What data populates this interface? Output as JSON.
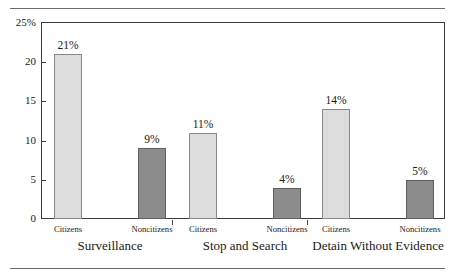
{
  "chart_data": {
    "type": "bar",
    "title": "",
    "subtitle": "",
    "xlabel": "",
    "ylabel": "",
    "ylim": [
      0,
      25
    ],
    "grid": false,
    "legend_position": "none",
    "categories": [
      "Surveillance",
      "Stop and Search",
      "Detain Without Evidence"
    ],
    "series": [
      {
        "name": "Citizens",
        "values": [
          21,
          11,
          14
        ],
        "color": "#dcdcdc"
      },
      {
        "name": "Noncitizens",
        "values": [
          9,
          4,
          5
        ],
        "color": "#8c8c8c"
      }
    ],
    "data_labels": [
      [
        "21%",
        "9%"
      ],
      [
        "11%",
        "4%"
      ],
      [
        "14%",
        "5%"
      ]
    ],
    "yticks": [
      {
        "value": 25,
        "label": "25%"
      },
      {
        "value": 20,
        "label": "20"
      },
      {
        "value": 15,
        "label": "15"
      },
      {
        "value": 10,
        "label": "10"
      },
      {
        "value": 5,
        "label": "5"
      },
      {
        "value": 0,
        "label": "0"
      }
    ],
    "groups": [
      {
        "label": "Surveillance",
        "bars": [
          {
            "series": "Citizens",
            "label": "Citizens",
            "value": 21,
            "value_label": "21%"
          },
          {
            "series": "Noncitizens",
            "label": "Noncitizens",
            "value": 9,
            "value_label": "9%"
          }
        ]
      },
      {
        "label": "Stop and Search",
        "bars": [
          {
            "series": "Citizens",
            "label": "Citizens",
            "value": 11,
            "value_label": "11%"
          },
          {
            "series": "Noncitizens",
            "label": "Noncitizens",
            "value": 4,
            "value_label": "4%"
          }
        ]
      },
      {
        "label": "Detain Without Evidence",
        "bars": [
          {
            "series": "Citizens",
            "label": "Citizens",
            "value": 14,
            "value_label": "14%"
          },
          {
            "series": "Noncitizens",
            "label": "Noncitizens",
            "value": 5,
            "value_label": "5%"
          }
        ]
      }
    ]
  },
  "colors": {
    "citizens_bar": "#dcdcdc",
    "noncitizens_bar": "#8c8c8c",
    "axis": "#3a3a3a",
    "rule": "#6b6b6b",
    "text": "#1a1a1a",
    "background": "#ffffff"
  }
}
